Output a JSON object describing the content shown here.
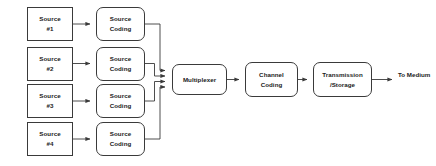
{
  "diagram": {
    "type": "block-flow-diagram",
    "canvas": {
      "width": 436,
      "height": 166
    },
    "colors": {
      "background": "#ffffff",
      "stroke": "#3a3a3a",
      "text": "#1a1a1a",
      "node_fill": "#ffffff"
    },
    "nodes": {
      "source_1": {
        "line1": "Source",
        "line2": "#1",
        "shape": "rect"
      },
      "source_2": {
        "line1": "Source",
        "line2": "#2",
        "shape": "rect"
      },
      "source_3": {
        "line1": "Source",
        "line2": "#3",
        "shape": "rect"
      },
      "source_4": {
        "line1": "Source",
        "line2": "#4",
        "shape": "rect"
      },
      "source_coding_1": {
        "line1": "Source",
        "line2": "Coding",
        "shape": "rounded-rect"
      },
      "source_coding_2": {
        "line1": "Source",
        "line2": "Coding",
        "shape": "rounded-rect"
      },
      "source_coding_3": {
        "line1": "Source",
        "line2": "Coding",
        "shape": "rounded-rect"
      },
      "source_coding_4": {
        "line1": "Source",
        "line2": "Coding",
        "shape": "rounded-rect"
      },
      "multiplexer": {
        "line1": "Multiplexer",
        "line2": "",
        "shape": "rounded-rect"
      },
      "channel_coding": {
        "line1": "Channel",
        "line2": "Coding",
        "shape": "rounded-rect"
      },
      "transmission_storage": {
        "line1": "Transmission",
        "line2": "/Storage",
        "shape": "rounded-rect"
      }
    },
    "labels": {
      "to_medium": {
        "line1": "To",
        "line2": "Medium"
      }
    },
    "edges": [
      {
        "from": "source_1",
        "to": "source_coding_1",
        "style": "arrow"
      },
      {
        "from": "source_2",
        "to": "source_coding_2",
        "style": "arrow"
      },
      {
        "from": "source_3",
        "to": "source_coding_3",
        "style": "arrow"
      },
      {
        "from": "source_4",
        "to": "source_coding_4",
        "style": "arrow"
      },
      {
        "from": "source_coding_1",
        "to": "multiplexer",
        "style": "elbow-arrow"
      },
      {
        "from": "source_coding_2",
        "to": "multiplexer",
        "style": "elbow-arrow"
      },
      {
        "from": "source_coding_3",
        "to": "multiplexer",
        "style": "elbow-arrow"
      },
      {
        "from": "source_coding_4",
        "to": "multiplexer",
        "style": "elbow-arrow"
      },
      {
        "from": "multiplexer",
        "to": "channel_coding",
        "style": "arrow"
      },
      {
        "from": "channel_coding",
        "to": "transmission_storage",
        "style": "arrow"
      },
      {
        "from": "transmission_storage",
        "to": "to_medium",
        "style": "arrow"
      }
    ]
  }
}
